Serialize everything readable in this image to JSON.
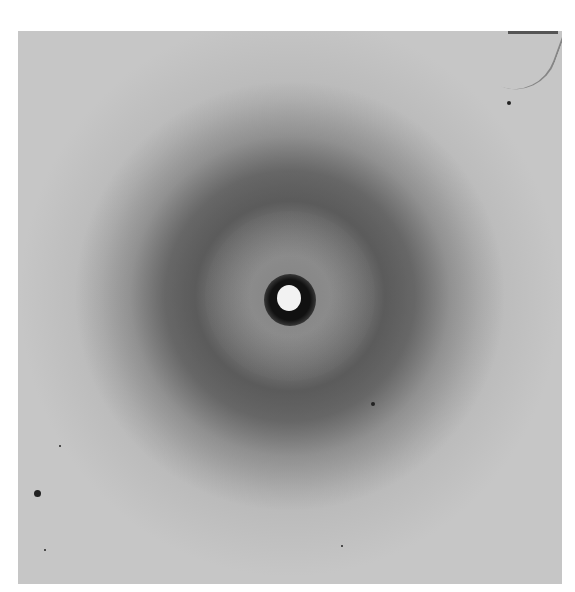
{
  "figure": {
    "caption_fragment": "",
    "colors": {
      "background": "#c6c6c6",
      "ring": "#4a4a4a",
      "beamstop": "#111111",
      "center_spot": "#f2f2f2"
    }
  }
}
